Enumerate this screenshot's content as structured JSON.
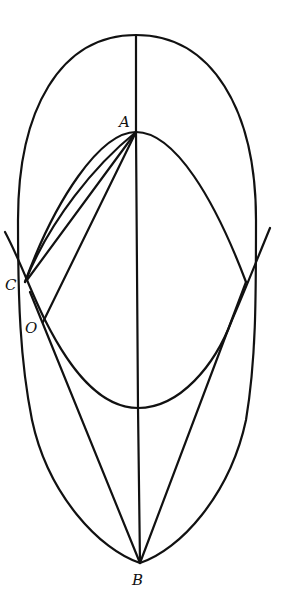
{
  "diagram": {
    "type": "geometric-construction",
    "stroke_color": "#111111",
    "background": "#ffffff",
    "points": {
      "A": {
        "label": "A",
        "x": 136,
        "y": 132
      },
      "B": {
        "label": "B",
        "x": 140,
        "y": 563
      },
      "C": {
        "label": "C",
        "x": 25,
        "y": 282
      },
      "O": {
        "label": "O",
        "x": 42,
        "y": 323
      },
      "R": {
        "label": "",
        "x": 246,
        "y": 282
      }
    },
    "labels": {
      "A": "A",
      "B": "B",
      "C": "C",
      "O": "O"
    },
    "elements": [
      {
        "name": "outer-oval",
        "kind": "closed-curve",
        "top": [
          136,
          35
        ],
        "bottom": [
          140,
          563
        ]
      },
      {
        "name": "inner-arch",
        "kind": "parabola",
        "apex": "A",
        "through": [
          "C",
          "R"
        ]
      },
      {
        "name": "lower-cup",
        "kind": "parabola",
        "vertex": [
          138,
          408
        ],
        "through": [
          "C",
          "R"
        ]
      },
      {
        "name": "axis",
        "kind": "segment",
        "from": [
          136,
          35
        ],
        "to": "B"
      },
      {
        "name": "chord-AC",
        "kind": "segment",
        "from": "A",
        "to": "C"
      },
      {
        "name": "chord-AO",
        "kind": "segment",
        "from": "A",
        "to": "O"
      },
      {
        "name": "arc-AC",
        "kind": "arc",
        "from": "A",
        "to": "C"
      },
      {
        "name": "line-BO",
        "kind": "segment",
        "from": "B",
        "to": "O"
      },
      {
        "name": "line-BR",
        "kind": "segment",
        "from": "B",
        "to": "R"
      }
    ]
  }
}
